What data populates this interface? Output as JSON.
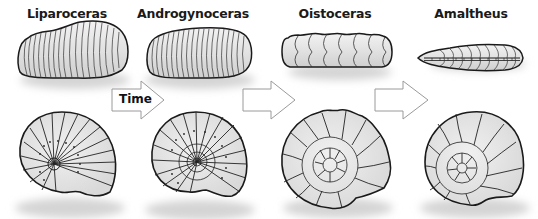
{
  "diagram": {
    "type": "evolutionary sequence illustration",
    "species": [
      {
        "name": "Liparoceras",
        "center_x": 67
      },
      {
        "name": "Androgynoceras",
        "center_x": 193
      },
      {
        "name": "Oistoceras",
        "center_x": 335
      },
      {
        "name": "Amaltheus",
        "center_x": 471
      }
    ],
    "arrows": [
      {
        "label": "Time",
        "from": "Androgynoceras",
        "position": "between Liparoceras and Androgynoceras"
      },
      {
        "label": "",
        "position": "between Androgynoceras and Oistoceras"
      },
      {
        "label": "",
        "position": "between Oistoceras and Amaltheus"
      }
    ],
    "views": [
      "ventral (top row)",
      "lateral (bottom row)"
    ],
    "colors": {
      "shell_fill": "#e8e8e8",
      "outline": "#1a1a1a",
      "shadow": "#d6d6d6",
      "arrow_stroke": "#9a9a9a"
    }
  }
}
